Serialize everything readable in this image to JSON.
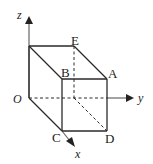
{
  "diagram": {
    "type": "3d-cuboid-coordinate-axes",
    "axes": {
      "x": {
        "label": "x"
      },
      "y": {
        "label": "y"
      },
      "z": {
        "label": "z"
      }
    },
    "origin": {
      "label": "O"
    },
    "vertices": {
      "A": {
        "label": "A"
      },
      "B": {
        "label": "B"
      },
      "C": {
        "label": "C"
      },
      "D": {
        "label": "D"
      },
      "E": {
        "label": "E"
      }
    },
    "colors": {
      "line": "#2a2a2a",
      "axis": "#666666",
      "background": "#ffffff"
    }
  }
}
